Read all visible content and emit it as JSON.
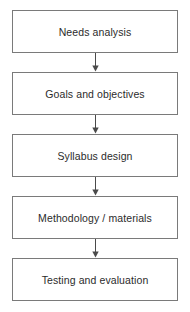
{
  "diagram": {
    "type": "flowchart",
    "orientation": "vertical",
    "colors": {
      "background": "#ffffff",
      "box_border": "#7a7a7a",
      "box_fill": "#ffffff",
      "text": "#2b2b2b",
      "arrow": "#4a4a4a"
    },
    "nodes": [
      {
        "id": "node-1",
        "label": "Needs analysis"
      },
      {
        "id": "node-2",
        "label": "Goals and objectives"
      },
      {
        "id": "node-3",
        "label": "Syllabus design"
      },
      {
        "id": "node-4",
        "label": "Methodology / materials"
      },
      {
        "id": "node-5",
        "label": "Testing and evaluation"
      }
    ],
    "connectors": [
      {
        "id": "arrow-1",
        "icon": "arrow-down-icon",
        "from": "node-1",
        "to": "node-2"
      },
      {
        "id": "arrow-2",
        "icon": "arrow-down-icon",
        "from": "node-2",
        "to": "node-3"
      },
      {
        "id": "arrow-3",
        "icon": "arrow-down-icon",
        "from": "node-3",
        "to": "node-4"
      },
      {
        "id": "arrow-4",
        "icon": "arrow-down-icon",
        "from": "node-4",
        "to": "node-5"
      }
    ]
  }
}
